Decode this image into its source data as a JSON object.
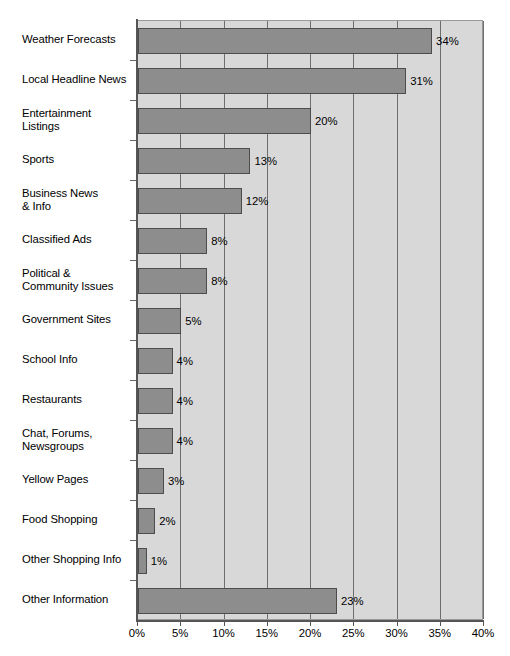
{
  "chart_data": {
    "type": "bar",
    "orientation": "horizontal",
    "title": "",
    "subtitle": "",
    "xlabel": "",
    "ylabel": "",
    "xlim": [
      0,
      40
    ],
    "xtick_labels": [
      "0%",
      "5%",
      "10%",
      "15%",
      "20%",
      "25%",
      "30%",
      "35%",
      "40%"
    ],
    "xtick_values": [
      0,
      5,
      10,
      15,
      20,
      25,
      30,
      35,
      40
    ],
    "grid": true,
    "legend": false,
    "categories": [
      "Weather Forecasts",
      "Local Headline News",
      "Entertainment\nListings",
      "Sports",
      "Business News\n& Info",
      "Classified Ads",
      "Political &\nCommunity Issues",
      "Government Sites",
      "School Info",
      "Restaurants",
      "Chat, Forums,\nNewsgroups",
      "Yellow Pages",
      "Food Shopping",
      "Other Shopping Info",
      "Other Information"
    ],
    "values": [
      34,
      31,
      20,
      13,
      12,
      8,
      8,
      5,
      4,
      4,
      4,
      3,
      2,
      1,
      23
    ],
    "data_labels": [
      "34%",
      "31%",
      "20%",
      "13%",
      "12%",
      "8%",
      "8%",
      "5%",
      "4%",
      "4%",
      "4%",
      "3%",
      "2%",
      "1%",
      "23%"
    ],
    "colors": {
      "bar_fill": "#8d8d8d",
      "bar_border": "#4c4c4c",
      "plot_background": "#d8d8d8",
      "gridline": "#6e6e6e",
      "axis": "#555555",
      "text": "#000000",
      "page_background": "#ffffff"
    }
  }
}
